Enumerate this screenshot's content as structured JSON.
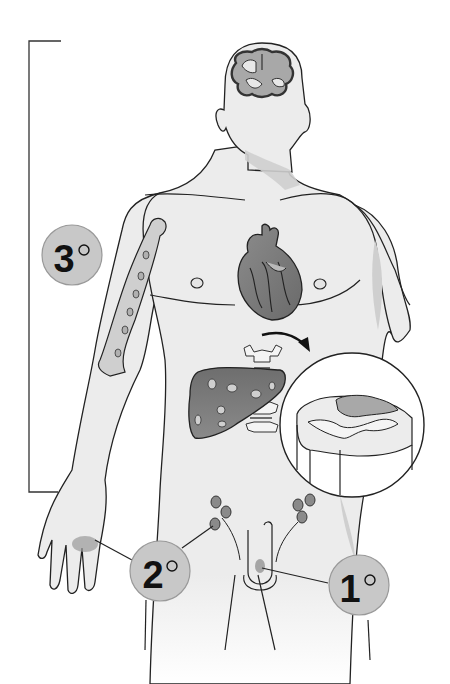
{
  "diagram": {
    "type": "anatomical-illustration",
    "labels": [
      {
        "id": "primary",
        "text": "1",
        "suffix": "°",
        "site": "genital lesion"
      },
      {
        "id": "secondary",
        "text": "2",
        "suffix": "°",
        "site": "palm rash and lymph nodes"
      },
      {
        "id": "tertiary",
        "text": "3",
        "suffix": "°",
        "site": "brain, heart, bone, liver, spinal cord"
      }
    ],
    "organs": [
      "brain",
      "heart",
      "humerus-bone",
      "liver",
      "vertebrae",
      "spinal-cord-cross-section",
      "inguinal-lymph-nodes"
    ],
    "colors": {
      "skin": "#ececec",
      "outline": "#222222",
      "label_fill": "#c8c8c8",
      "organ_dark": "#7a7a7a",
      "organ_mid": "#a8a8a8",
      "lesion": "#9a9a9a",
      "shadow": "#cfcfcf"
    }
  }
}
